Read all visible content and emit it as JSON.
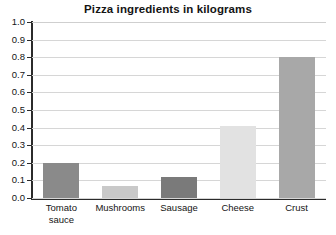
{
  "chart_data": {
    "type": "bar",
    "title": "Pizza ingredients in kilograms",
    "xlabel": "",
    "ylabel": "",
    "categories": [
      "Tomato sauce",
      "Mushrooms",
      "Sausage",
      "Cheese",
      "Crust"
    ],
    "values": [
      0.2,
      0.07,
      0.12,
      0.41,
      0.8
    ],
    "ylim": [
      0.0,
      1.0
    ],
    "ytick_step": 0.1,
    "ytick_labels": [
      "0.0",
      "0.1",
      "0.2",
      "0.3",
      "0.4",
      "0.5",
      "0.6",
      "0.7",
      "0.8",
      "0.9",
      "1.0"
    ],
    "grid": true,
    "legend": false,
    "bar_colors": [
      "#8a8a8a",
      "#c9c9c9",
      "#7a7a7a",
      "#e2e2e2",
      "#a8a8a8"
    ],
    "axis_color": "#2b2b2b",
    "gridline_color": "#d6d6d6",
    "background_color": "#ffffff",
    "bars": [
      {
        "category": "Tomato sauce",
        "label": "Tomato\nsauce",
        "value": 0.2,
        "color": "#8a8a8a"
      },
      {
        "category": "Mushrooms",
        "label": "Mushrooms",
        "value": 0.07,
        "color": "#c9c9c9"
      },
      {
        "category": "Sausage",
        "label": "Sausage",
        "value": 0.12,
        "color": "#7a7a7a"
      },
      {
        "category": "Cheese",
        "label": "Cheese",
        "value": 0.41,
        "color": "#e2e2e2"
      },
      {
        "category": "Crust",
        "label": "Crust",
        "value": 0.8,
        "color": "#a8a8a8"
      }
    ]
  }
}
